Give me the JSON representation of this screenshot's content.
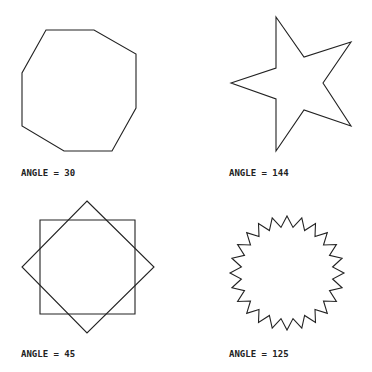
{
  "figure": {
    "panels": [
      {
        "label": "ANGLE = 30",
        "shape": "octagon",
        "points": "46,30 94,30 136,54 136,108 112,151 64,151 22,126 22,73"
      },
      {
        "label": "ANGLE = 144",
        "shape": "five-pointed-star",
        "points": "276,17 304,57 351,42 323,83 351,126 304,110 276,151 276,99 231,83 276,68"
      },
      {
        "label": "ANGLE = 45",
        "shape": "overlapping-squares",
        "square_points": "40,220 135,220 135,314 40,314",
        "diamond_points": "87,201 154,267 87,333 22,267"
      },
      {
        "label": "ANGLE = 125",
        "shape": "starburst",
        "center": [
          287,
          273
        ],
        "outer_radius": 57,
        "inner_radius": 46,
        "spikes": 24
      }
    ],
    "stroke_color": "#222222",
    "background_color": "#ffffff"
  }
}
